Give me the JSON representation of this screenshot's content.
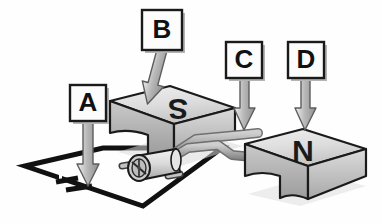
{
  "figure": {
    "kind": "labeled-physics-diagram",
    "background_color": "#fefefe"
  },
  "callouts": [
    {
      "id": "A",
      "label": "A",
      "points_to": "battery-symbol-in-circuit",
      "box": {
        "x": 70,
        "y": 85,
        "w": 36,
        "h": 36
      },
      "arrow": {
        "x1": 88,
        "y1": 121,
        "x2": 88,
        "y2": 183,
        "style": "straight-down"
      }
    },
    {
      "id": "B",
      "label": "B",
      "points_to": "south-pole-magnet-block",
      "box": {
        "x": 142,
        "y": 10,
        "w": 40,
        "h": 40
      },
      "arrow": {
        "x1": 162,
        "y1": 50,
        "x2": 178,
        "y2": 110,
        "style": "slanted-down-right"
      }
    },
    {
      "id": "C",
      "label": "C",
      "points_to": "armature-coil-wire",
      "box": {
        "x": 226,
        "y": 42,
        "w": 36,
        "h": 36
      },
      "arrow": {
        "x1": 244,
        "y1": 78,
        "x2": 246,
        "y2": 131,
        "style": "straight-down"
      }
    },
    {
      "id": "D",
      "label": "D",
      "points_to": "north-pole-magnet-block",
      "box": {
        "x": 288,
        "y": 42,
        "w": 36,
        "h": 36
      },
      "arrow": {
        "x1": 306,
        "y1": 78,
        "x2": 304,
        "y2": 131,
        "style": "straight-down"
      }
    }
  ],
  "magnets": [
    {
      "id": "south",
      "pole_letter": "S",
      "rotation_deg": 180,
      "face_color": "#d6d6d6",
      "side_color": "#9a9a9a"
    },
    {
      "id": "north",
      "pole_letter": "N",
      "rotation_deg": 180,
      "face_color": "#d6d6d6",
      "side_color": "#9a9a9a"
    }
  ],
  "parts": {
    "circuit_wire": {
      "name": "circuit-wire-loop",
      "color": "#111111"
    },
    "battery": {
      "name": "battery-symbol",
      "color": "#111111"
    },
    "cylinder": {
      "name": "rotor-cylinder",
      "color": "#d9d9d9"
    },
    "coil": {
      "name": "armature-coil-tube",
      "color": "#9e9e9e"
    }
  },
  "palette": {
    "ink": "#111111",
    "light_gray": "#e8e8e8",
    "mid_gray": "#bdbdbd",
    "dark_gray": "#8a8a8a",
    "shadow": "#b7b7b7",
    "label_fill": "#fcfcfc"
  }
}
